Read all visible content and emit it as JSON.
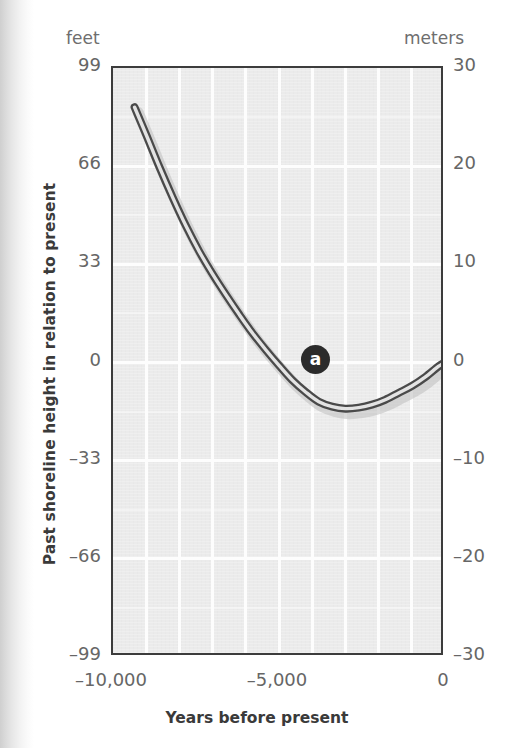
{
  "figure": {
    "left_unit_header": "feet",
    "right_unit_header": "meters",
    "y_axis_title": "Past shoreline height in relation to present",
    "x_axis_title": "Years before present",
    "marker_label": "a",
    "colors": {
      "plot_background": "#ebebeb",
      "gridline": "#fdfdfd",
      "frame": "#3c3c3c",
      "curve_dark": "#4a4a4a",
      "curve_light": "#d8d8d8",
      "marker_badge": "#2b2b2b",
      "tick_text": "#666666",
      "title_text": "#3a3a3a",
      "unit_header_text": "#6e6e6e"
    }
  },
  "chart_data": {
    "type": "line",
    "title": "",
    "subtitle": "",
    "xlabel": "Years before present",
    "ylabel": "Past shoreline height in relation to present",
    "x_unit": "years before present",
    "y_unit_primary": "feet",
    "y_unit_secondary": "meters",
    "xlim": [
      -10000,
      0
    ],
    "ylim_feet": [
      -99,
      99
    ],
    "ylim_meters": [
      -30,
      30
    ],
    "xticks": [
      -10000,
      -5000,
      0
    ],
    "xticklabels": [
      "–10,000",
      "–5,000",
      "0"
    ],
    "yticks_feet": [
      99,
      66,
      33,
      0,
      -33,
      -66,
      -99
    ],
    "yticklabels_feet": [
      "99",
      "66",
      "33",
      "0",
      "–33",
      "–66",
      "–99"
    ],
    "yticks_meters": [
      30,
      20,
      10,
      0,
      -10,
      -20,
      -30
    ],
    "yticklabels_meters": [
      "30",
      "20",
      "10",
      "0",
      "–10",
      "–20",
      "–30"
    ],
    "grid": true,
    "grid_vertical_count": 9,
    "grid_horizontal_count": 6,
    "legend": "none",
    "legend_position": "none",
    "annotations": [
      {
        "label": "a",
        "x": -3900,
        "y_meters": 0.3,
        "y_feet": 1.0,
        "style": "dark-circle-badge"
      }
    ],
    "series": [
      {
        "name": "Past shoreline height",
        "x": [
          -9350,
          -9000,
          -8600,
          -8200,
          -7800,
          -7400,
          -7000,
          -6600,
          -6200,
          -5800,
          -5400,
          -5000,
          -4600,
          -4200,
          -3800,
          -3400,
          -3000,
          -2600,
          -2200,
          -1800,
          -1400,
          -1000,
          -600,
          -200,
          0
        ],
        "y_meters": [
          26.0,
          23.2,
          19.9,
          16.8,
          13.9,
          11.3,
          9.0,
          6.9,
          4.9,
          3.0,
          1.3,
          -0.3,
          -1.8,
          -3.0,
          -4.0,
          -4.5,
          -4.7,
          -4.6,
          -4.3,
          -3.8,
          -3.1,
          -2.4,
          -1.5,
          -0.4,
          0.0
        ],
        "y_feet": [
          85.3,
          76.1,
          65.3,
          55.1,
          45.6,
          37.1,
          29.5,
          22.6,
          16.1,
          9.8,
          4.3,
          -1.0,
          -5.9,
          -9.8,
          -13.1,
          -14.8,
          -15.4,
          -15.1,
          -14.1,
          -12.5,
          -10.2,
          -7.9,
          -4.9,
          -1.3,
          0.0
        ],
        "style": "thick-shaded-line"
      }
    ]
  }
}
